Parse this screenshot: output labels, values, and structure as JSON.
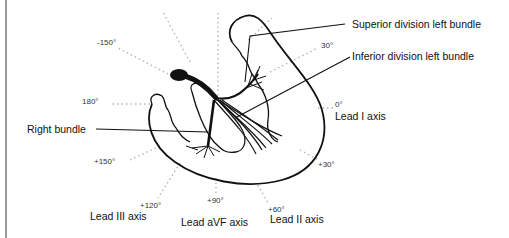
{
  "diagram": {
    "title_labels": {
      "superior": "Superior division left bundle",
      "inferior": "Inferior division left bundle",
      "right": "Right bundle"
    },
    "angles": [
      {
        "id": "m150",
        "label": "-150°"
      },
      {
        "id": "d180",
        "label": "180°"
      },
      {
        "id": "p150",
        "label": "+150°"
      },
      {
        "id": "p120",
        "label": "+120°"
      },
      {
        "id": "p90",
        "label": "+90°"
      },
      {
        "id": "p60",
        "label": "+60°"
      },
      {
        "id": "p30",
        "label": "+30°"
      },
      {
        "id": "d0",
        "label": "0°"
      },
      {
        "id": "m30",
        "label": "30°"
      }
    ],
    "leads": {
      "lead1": "Lead I axis",
      "lead2": "Lead II axis",
      "lead3": "Lead III axis",
      "leadavf": "Lead aVF axis"
    },
    "colors": {
      "ink": "#111111",
      "dots": "#b5b5b5",
      "border": "#9a9a9a"
    }
  }
}
